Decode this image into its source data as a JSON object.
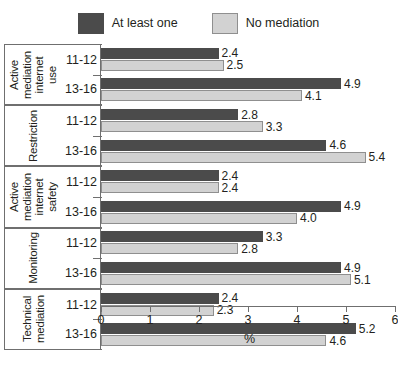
{
  "chart_data": {
    "type": "bar",
    "orientation": "horizontal",
    "title": "",
    "xlabel": "%",
    "ylabel": "",
    "xlim": [
      0,
      6
    ],
    "xticks": [
      0,
      1,
      2,
      3,
      4,
      5,
      6
    ],
    "grid": false,
    "legend_position": "top-center",
    "series": [
      {
        "name": "At least one",
        "color": "#4b4b4b"
      },
      {
        "name": "No mediation",
        "color": "#d2d2d2"
      }
    ],
    "groups": [
      {
        "label": "Active mediation internet use",
        "label_lines": [
          "Active",
          "mediation",
          "internet",
          "use"
        ],
        "rows": [
          {
            "category": "11-12",
            "values": [
              2.4,
              2.5
            ],
            "labels": [
              "2.4",
              "2.5"
            ]
          },
          {
            "category": "13-16",
            "values": [
              4.9,
              4.1
            ],
            "labels": [
              "4.9",
              "4.1"
            ]
          }
        ]
      },
      {
        "label": "Restriction",
        "label_lines": [
          "Restriction"
        ],
        "rows": [
          {
            "category": "11-12",
            "values": [
              2.8,
              3.3
            ],
            "labels": [
              "2.8",
              "3.3"
            ]
          },
          {
            "category": "13-16",
            "values": [
              4.6,
              5.4
            ],
            "labels": [
              "4.6",
              "5.4"
            ]
          }
        ]
      },
      {
        "label": "Active mediation internet safety",
        "label_lines": [
          "Active",
          "mediation",
          "internet",
          "safety"
        ],
        "rows": [
          {
            "category": "11-12",
            "values": [
              2.4,
              2.4
            ],
            "labels": [
              "2.4",
              "2.4"
            ]
          },
          {
            "category": "13-16",
            "values": [
              4.9,
              4.0
            ],
            "labels": [
              "4.9",
              "4.0"
            ]
          }
        ]
      },
      {
        "label": "Monitoring",
        "label_lines": [
          "Monitoring"
        ],
        "rows": [
          {
            "category": "11-12",
            "values": [
              3.3,
              2.8
            ],
            "labels": [
              "3.3",
              "2.8"
            ]
          },
          {
            "category": "13-16",
            "values": [
              4.9,
              5.1
            ],
            "labels": [
              "4.9",
              "5.1"
            ]
          }
        ]
      },
      {
        "label": "Technical mediation",
        "label_lines": [
          "Technical",
          "mediation"
        ],
        "rows": [
          {
            "category": "11-12",
            "values": [
              2.4,
              2.3
            ],
            "labels": [
              "2.4",
              "2.3"
            ]
          },
          {
            "category": "13-16",
            "values": [
              5.2,
              4.6
            ],
            "labels": [
              "5.2",
              "4.6"
            ]
          }
        ]
      }
    ]
  },
  "legend": {
    "items": [
      {
        "label": "At least one",
        "color": "#4b4b4b"
      },
      {
        "label": "No mediation",
        "color": "#d2d2d2"
      }
    ]
  },
  "axis": {
    "tick_labels": [
      "0",
      "1",
      "2",
      "3",
      "4",
      "5",
      "6"
    ],
    "unit_label": "%"
  }
}
